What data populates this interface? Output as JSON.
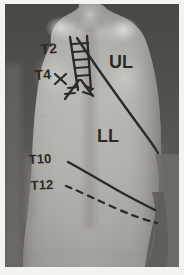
{
  "image": {
    "kind": "clinical-photograph",
    "subject": "posterior thorax / human back",
    "orientation": "posterior view, standing",
    "tone": "grayscale",
    "border": "white photographic margin",
    "width": 184,
    "height": 275
  },
  "palette": {
    "background_dark": "#4a4a47",
    "skin_mid": "#a9a7a1",
    "skin_light": "#c8c6c0",
    "skin_highlight": "#dddbd5",
    "skin_shadow": "#7c7a75",
    "deep_shadow": "#55534f",
    "marker_ink": "#1d1c1a",
    "frame_white": "#ffffff"
  },
  "markings": {
    "vertebral_labels": [
      {
        "id": "label-t2",
        "text": "T2",
        "x": 40,
        "y": 44,
        "rotate": -4
      },
      {
        "id": "label-t4",
        "text": "T4",
        "x": 35,
        "y": 68,
        "rotate": -4
      },
      {
        "id": "label-t10",
        "text": "T10",
        "x": 30,
        "y": 154,
        "rotate": -3
      },
      {
        "id": "label-t12",
        "text": "T12",
        "x": 31,
        "y": 180,
        "rotate": -3
      }
    ],
    "region_labels": [
      {
        "id": "label-ul",
        "text": "UL",
        "x": 112,
        "y": 56,
        "meaning": "upper lobe region"
      },
      {
        "id": "label-ll",
        "text": "LL",
        "x": 100,
        "y": 126,
        "meaning": "lower lobe region"
      }
    ],
    "lines": [
      {
        "id": "midline-ladder",
        "style": "solid",
        "description": "vertical ladder of rungs over spinous processes"
      },
      {
        "id": "oblique-fissure-line",
        "style": "solid",
        "description": "long diagonal line from midline to lateral chest wall"
      },
      {
        "id": "t10-curve",
        "style": "solid",
        "description": "curved line at T10 level across lower back"
      },
      {
        "id": "t12-dashed",
        "style": "dashed",
        "description": "dashed curved line at T12 level across lower back"
      },
      {
        "id": "t4-cross-marks",
        "style": "solid",
        "description": "X cross marks and V branch at T4 level"
      }
    ]
  }
}
